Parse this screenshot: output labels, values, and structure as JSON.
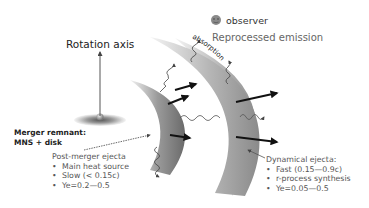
{
  "figure": {
    "rotation_axis_label": "Rotation axis",
    "observer_label": "observer",
    "observer_icon": "face-icon",
    "reprocessed_label": "Reprocessed emission",
    "absorption_label": "absorption",
    "merger_remnant": {
      "line1": "Merger remnant:",
      "line2": "MNS + disk"
    },
    "post_merger_ejecta": {
      "title": "Post-merger ejecta",
      "bullets": [
        "Main heat source",
        "Slow (< 0.15c)",
        "Ye=0.2—0.5"
      ]
    },
    "dynamical_ejecta": {
      "title": "Dynamical ejecta:",
      "bullets": [
        "Fast (0.15—0.9c)",
        "r-process synthesis",
        "Ye=0.05—0.5"
      ]
    }
  },
  "colors": {
    "shell_dark": "#6e6e6e",
    "shell_light": "#dcdcdc",
    "arrow": "#111111",
    "text_dark": "#222222",
    "text_gray": "#555555"
  }
}
